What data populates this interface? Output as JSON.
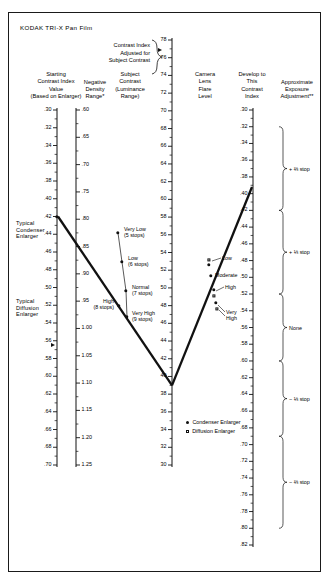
{
  "title": "KODAK TRI-X Pan Film",
  "headers": {
    "center_callout": [
      "Contrast Index",
      "Adjusted for",
      "Subject Contrast"
    ],
    "col1": [
      "Starting",
      "Contrast Index",
      "Value",
      "(Based on Enlarger)"
    ],
    "col2": [
      "Negative",
      "Density",
      "Range*"
    ],
    "col3": [
      "Subject",
      "Contrast",
      "(Luminance",
      "Range)"
    ],
    "col4": [
      "Camera",
      "Lens",
      "Flare",
      "Level"
    ],
    "col5": [
      "Develop to",
      "This",
      "Contrast",
      "Index"
    ],
    "col6": [
      "Approximate",
      "Exposure",
      "Adjustment**"
    ]
  },
  "side_labels": {
    "condenser": [
      "Typical",
      "Condenser",
      "Enlarger"
    ],
    "diffusion": [
      "Typical",
      "Diffusion",
      "Enlarger"
    ]
  },
  "legend": [
    {
      "marker": "filled-circle",
      "label": "Condenser Enlarger"
    },
    {
      "marker": "open-square",
      "label": "Diffusion Enlarger"
    }
  ],
  "chart_data": {
    "type": "nomograph",
    "axes": [
      {
        "name": "starting_contrast_index",
        "label": "Starting Contrast Index Value (Based on Enlarger)",
        "min": 0.3,
        "max": 0.7,
        "step": 0.02,
        "ticks": [
          ".30",
          ".32",
          ".34",
          ".36",
          ".38",
          ".40",
          ".42",
          ".44",
          ".46",
          ".48",
          ".50",
          ".52",
          ".54",
          ".56",
          ".58",
          ".60",
          ".62",
          ".64",
          ".66",
          ".68",
          ".70"
        ],
        "markers": [
          {
            "value": 0.42,
            "type": "filled-circle",
            "note": "Typical Condenser Enlarger"
          },
          {
            "value": 0.565,
            "type": "arrow",
            "note": "Typical Diffusion Enlarger"
          }
        ]
      },
      {
        "name": "negative_density_range",
        "label": "Negative Density Range*",
        "min": 0.6,
        "max": 1.25,
        "step": 0.05,
        "ticks": [
          ".60",
          ".65",
          ".70",
          ".75",
          ".80",
          ".85",
          ".90",
          ".95",
          "1.00",
          "1.05",
          "1.10",
          "1.15",
          "1.20",
          "1.25"
        ]
      },
      {
        "name": "contrast_index_adjusted",
        "label": "Contrast Index Adjusted for Subject Contrast",
        "min": 30,
        "max": 78,
        "step": 2,
        "ticks": [
          "78",
          "76",
          "74",
          "72",
          "70",
          "68",
          "66",
          "64",
          "62",
          "60",
          "58",
          "56",
          "54",
          "52",
          "50",
          "48",
          "46",
          "44",
          "42",
          "40",
          "38",
          "36",
          "34",
          "32",
          "30"
        ]
      },
      {
        "name": "develop_to_contrast_index",
        "label": "Develop to This Contrast Index",
        "min": 0.3,
        "max": 0.82,
        "step": 0.02,
        "ticks": [
          ".30",
          ".32",
          ".34",
          ".36",
          ".38",
          ".40",
          ".42",
          ".44",
          ".46",
          ".48",
          ".50",
          ".52",
          ".54",
          ".56",
          ".58",
          ".60",
          ".62",
          ".64",
          ".66",
          ".68",
          ".70",
          ".72",
          ".74",
          ".76",
          ".78",
          ".80",
          ".82"
        ]
      }
    ],
    "subject_contrast_points": [
      {
        "label": "Very Low",
        "stops": "(5 stops)",
        "marker": "filled-circle"
      },
      {
        "label": "Low",
        "stops": "(6 stops)",
        "marker": "filled-circle"
      },
      {
        "label": "Normal",
        "stops": "(7 stops)",
        "marker": "filled-circle"
      },
      {
        "label": "High",
        "stops": "(8 stops)",
        "marker": "filled-circle"
      },
      {
        "label": "Very High",
        "stops": "(9 stops)",
        "marker": "filled-circle"
      }
    ],
    "flare_level_points": [
      {
        "label": "Low",
        "marker": "open-square"
      },
      {
        "label": "Low",
        "marker": "filled-circle"
      },
      {
        "label": "Moderate",
        "marker": "filled-circle"
      },
      {
        "label": "High",
        "marker": "filled-circle"
      },
      {
        "label": "High",
        "marker": "open-square"
      },
      {
        "label": "Very High",
        "marker": "filled-circle"
      },
      {
        "label": "Very High",
        "marker": "open-square"
      }
    ],
    "exposure_adjustment_brackets": [
      {
        "label": "+ ⅔ stop",
        "range": [
          0.32,
          0.42
        ]
      },
      {
        "label": "+ ⅓ stop",
        "range": [
          0.42,
          0.52
        ]
      },
      {
        "label": "None",
        "range": [
          0.52,
          0.6
        ]
      },
      {
        "label": "− ⅓ stop",
        "range": [
          0.6,
          0.69
        ]
      },
      {
        "label": "− ⅔ stop",
        "range": [
          0.69,
          0.8
        ]
      }
    ]
  }
}
